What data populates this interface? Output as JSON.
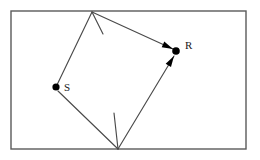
{
  "figure": {
    "type": "geometry-diagram",
    "background_color": "#ffffff",
    "line_color": "#4a4a4a",
    "frame_color": "#5a5a5a",
    "node_color": "#000000",
    "frame": {
      "x": 11,
      "y": 11,
      "width": 235,
      "height": 138
    },
    "nodes": [
      {
        "id": "S",
        "label": "S",
        "x": 56,
        "y": 87,
        "radius": 3.6,
        "label_x": 64,
        "label_y": 91
      },
      {
        "id": "R",
        "label": "R",
        "x": 176,
        "y": 51,
        "radius": 3.8,
        "label_x": 185,
        "label_y": 49
      }
    ],
    "vertices": [
      {
        "id": "top",
        "x": 92,
        "y": 12
      },
      {
        "id": "bottom",
        "x": 118,
        "y": 149
      }
    ],
    "segments": [
      {
        "id": "s-to-top",
        "from": "S",
        "to": "top",
        "x1": 56,
        "y1": 87,
        "x2": 92,
        "y2": 12,
        "arrow": false
      },
      {
        "id": "top-to-r",
        "from": "top",
        "to": "R",
        "x1": 92,
        "y1": 12,
        "x2": 173,
        "y2": 49,
        "arrow": true
      },
      {
        "id": "s-to-bottom",
        "from": "S",
        "to": "bottom",
        "x1": 58,
        "y1": 91,
        "x2": 118,
        "y2": 149,
        "arrow": false
      },
      {
        "id": "bottom-to-r",
        "from": "bottom",
        "to": "R",
        "x1": 118,
        "y1": 149,
        "x2": 174,
        "y2": 56,
        "arrow": true
      }
    ],
    "ticks": [
      {
        "id": "tick-top",
        "x1": 92,
        "y1": 12,
        "x2": 103,
        "y2": 34
      },
      {
        "id": "tick-bottom",
        "x1": 118,
        "y1": 149,
        "x2": 114,
        "y2": 113
      }
    ]
  }
}
